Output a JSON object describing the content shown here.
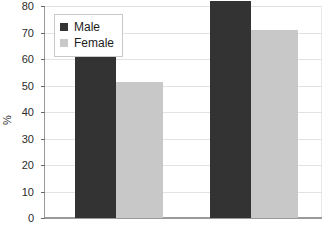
{
  "chart_data": {
    "type": "bar",
    "title": "",
    "subtitle": "",
    "xlabel": "",
    "ylabel": "%",
    "ylim": [
      0,
      80
    ],
    "ytick_step": 10,
    "yticks": [
      80,
      70,
      60,
      50,
      40,
      30,
      20,
      10,
      0
    ],
    "grid": true,
    "grid_axis": "y",
    "legend_position": "top-left inside plot area",
    "categories": [
      "Group 1",
      "Group 2"
    ],
    "category_labels_visible": false,
    "series": [
      {
        "name": "Male",
        "color": "#333333",
        "values": [
          61,
          82
        ]
      },
      {
        "name": "Female",
        "color": "#c8c8c8",
        "values": [
          51.5,
          71
        ]
      }
    ]
  },
  "legend": {
    "entries": [
      {
        "label": "Male",
        "color": "#333333"
      },
      {
        "label": "Female",
        "color": "#c8c8c8"
      }
    ]
  },
  "axis": {
    "y_title": "%",
    "tick_labels": [
      "80",
      "70",
      "60",
      "50",
      "40",
      "30",
      "20",
      "10",
      "0"
    ]
  },
  "colors": {
    "male": "#333333",
    "female": "#c8c8c8",
    "gridline": "#e3e3e3",
    "axis": "#9a9a9a",
    "text": "#2b2b2b",
    "background": "#ffffff",
    "legend_border": "#c9c9c9"
  }
}
